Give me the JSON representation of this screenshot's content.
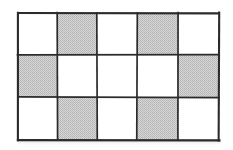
{
  "figure": {
    "type": "grid-diagram",
    "caption": "",
    "background_color": "#ffffff",
    "line_color": "#2b2b2b",
    "shaded_color": "#c9c9c9",
    "plain_color": "#ffffff",
    "columns": 5,
    "rows": 3,
    "geometry": {
      "left": 18,
      "top": 13,
      "right": 219,
      "bottom": 140,
      "column_x": [
        18,
        57,
        97,
        137,
        178,
        219
      ],
      "row_y": [
        13,
        55,
        97,
        140
      ],
      "outer_stroke_width": 2.1,
      "inner_stroke_width": 1.7
    },
    "cells": [
      [
        {
          "id": "r1c1",
          "shaded": false,
          "label": ""
        },
        {
          "id": "r1c2",
          "shaded": true,
          "label": ""
        },
        {
          "id": "r1c3",
          "shaded": false,
          "label": ""
        },
        {
          "id": "r1c4",
          "shaded": true,
          "label": ""
        },
        {
          "id": "r1c5",
          "shaded": false,
          "label": ""
        }
      ],
      [
        {
          "id": "r2c1",
          "shaded": true,
          "label": ""
        },
        {
          "id": "r2c2",
          "shaded": false,
          "label": ""
        },
        {
          "id": "r2c3",
          "shaded": false,
          "label": ""
        },
        {
          "id": "r2c4",
          "shaded": false,
          "label": ""
        },
        {
          "id": "r2c5",
          "shaded": true,
          "label": ""
        }
      ],
      [
        {
          "id": "r3c1",
          "shaded": false,
          "label": ""
        },
        {
          "id": "r3c2",
          "shaded": true,
          "label": ""
        },
        {
          "id": "r3c3",
          "shaded": false,
          "label": ""
        },
        {
          "id": "r3c4",
          "shaded": true,
          "label": ""
        },
        {
          "id": "r3c5",
          "shaded": false,
          "label": ""
        }
      ]
    ],
    "counts": {
      "total_cells": 15,
      "shaded_cells": 6,
      "plain_cells": 9
    }
  }
}
